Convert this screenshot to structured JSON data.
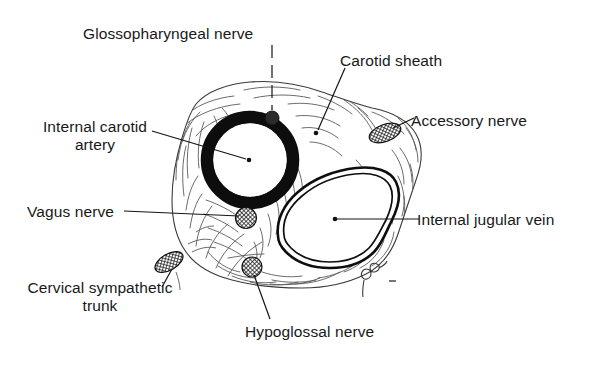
{
  "figure": {
    "background_color": "#ffffff",
    "ink_color": "#111111",
    "tissue_line_color": "#4a4a4a",
    "signature": "gco"
  },
  "labels": {
    "glossopharyngeal_nerve": "Glossopharyngeal nerve",
    "carotid_sheath": "Carotid sheath",
    "internal_carotid_artery_line1": "Internal carotid",
    "internal_carotid_artery_line2": "artery",
    "accessory_nerve": "Accessory nerve",
    "vagus_nerve": "Vagus nerve",
    "internal_jugular_vein": "Internal jugular vein",
    "cervical_sympathetic_trunk_line1": "Cervical sympathetic",
    "cervical_sympathetic_trunk_line2": "trunk",
    "hypoglossal_nerve": "Hypoglossal nerve"
  },
  "structures": [
    {
      "name": "internal-carotid-artery",
      "label": "Internal carotid artery",
      "marker": "thick-black-ring",
      "center": [
        250,
        160
      ],
      "radius": 43,
      "wall_thickness": 12,
      "fill": "#ffffff",
      "stroke": "#0d0d0d"
    },
    {
      "name": "internal-jugular-vein",
      "label": "Internal jugular vein",
      "marker": "double-line-oval",
      "center": [
        333,
        212
      ],
      "fill": "#ffffff",
      "stroke": "#0d0d0d"
    },
    {
      "name": "glossopharyngeal-nerve",
      "label": "Glossopharyngeal nerve",
      "marker": "solid-dark-circle",
      "center": [
        272,
        118
      ],
      "radius": 7
    },
    {
      "name": "accessory-nerve",
      "label": "Accessory nerve",
      "marker": "hatched-ellipse",
      "center": [
        385,
        133
      ],
      "rx": 16,
      "ry": 8,
      "rotation": -22
    },
    {
      "name": "vagus-nerve",
      "label": "Vagus nerve",
      "marker": "hatched-circle",
      "center": [
        246,
        218
      ],
      "radius": 10
    },
    {
      "name": "hypoglossal-nerve",
      "label": "Hypoglossal nerve",
      "marker": "hatched-circle",
      "center": [
        252,
        267
      ],
      "radius": 10
    },
    {
      "name": "cervical-sympathetic-trunk",
      "label": "Cervical sympathetic trunk",
      "marker": "hatched-ellipse",
      "center": [
        169,
        262
      ],
      "rx": 15,
      "ry": 8,
      "rotation": -28
    },
    {
      "name": "carotid-sheath",
      "label": "Carotid sheath",
      "marker": "dot",
      "center": [
        316,
        133
      ]
    }
  ],
  "leader_lines": [
    {
      "name": "leader-glossopharyngeal",
      "style": "dashed-vertical",
      "from": [
        272,
        45
      ],
      "to": [
        272,
        111
      ]
    },
    {
      "name": "leader-carotid-sheath",
      "style": "solid",
      "from": [
        344,
        68
      ],
      "to": [
        317,
        131
      ]
    },
    {
      "name": "leader-internal-carotid",
      "style": "solid",
      "from": [
        152,
        131
      ],
      "to": [
        247,
        159
      ]
    },
    {
      "name": "leader-accessory",
      "style": "solid",
      "from": [
        413,
        119
      ],
      "to": [
        392,
        129
      ]
    },
    {
      "name": "leader-vagus",
      "style": "solid",
      "from": [
        124,
        211
      ],
      "to": [
        241,
        217
      ]
    },
    {
      "name": "leader-jugular",
      "style": "solid",
      "from": [
        419,
        219
      ],
      "to": [
        337,
        219
      ]
    },
    {
      "name": "leader-sympathetic",
      "style": "solid",
      "from": [
        163,
        286
      ],
      "to": [
        170,
        268
      ]
    },
    {
      "name": "leader-hypoglossal",
      "style": "solid",
      "from": [
        268,
        320
      ],
      "to": [
        254,
        274
      ]
    }
  ]
}
